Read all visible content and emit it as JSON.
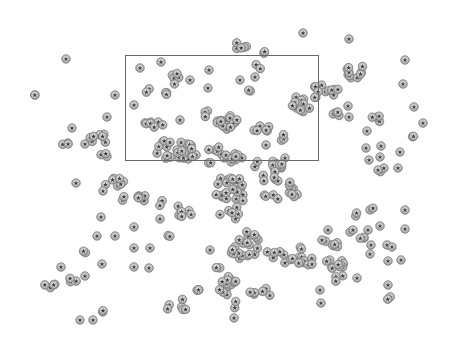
{
  "image": {
    "width": 451,
    "height": 343,
    "background": "#ffffff",
    "description": "Grayscale micrograph of spherical particles with a rectangular selection region"
  },
  "selection_box": {
    "x": 125,
    "y": 55,
    "width": 193,
    "height": 105,
    "stroke": "#6a6a6a"
  },
  "particle_style": {
    "radius": 4.2,
    "fill": "#d4d4d4",
    "ring": "#7a7a7a",
    "core": "#3a3a3a"
  },
  "clusters": [
    {
      "cx": 66,
      "cy": 59,
      "n": 1,
      "sx": 0,
      "sy": 0
    },
    {
      "cx": 34,
      "cy": 95,
      "n": 2,
      "sx": 3,
      "sy": 0
    },
    {
      "cx": 115,
      "cy": 95,
      "n": 1,
      "sx": 0,
      "sy": 0
    },
    {
      "cx": 107,
      "cy": 117,
      "n": 1,
      "sx": 0,
      "sy": 0
    },
    {
      "cx": 72,
      "cy": 128,
      "n": 1,
      "sx": 0,
      "sy": 0
    },
    {
      "cx": 66,
      "cy": 142,
      "n": 3,
      "sx": 5,
      "sy": 3
    },
    {
      "cx": 85,
      "cy": 144,
      "n": 1,
      "sx": 0,
      "sy": 0
    },
    {
      "cx": 98,
      "cy": 138,
      "n": 8,
      "sx": 10,
      "sy": 6
    },
    {
      "cx": 102,
      "cy": 155,
      "n": 3,
      "sx": 6,
      "sy": 2
    },
    {
      "cx": 140,
      "cy": 68,
      "n": 1,
      "sx": 0,
      "sy": 0
    },
    {
      "cx": 161,
      "cy": 62,
      "n": 1,
      "sx": 0,
      "sy": 0
    },
    {
      "cx": 175,
      "cy": 78,
      "n": 5,
      "sx": 4,
      "sy": 8
    },
    {
      "cx": 146,
      "cy": 90,
      "n": 2,
      "sx": 5,
      "sy": 3
    },
    {
      "cx": 165,
      "cy": 95,
      "n": 3,
      "sx": 4,
      "sy": 3
    },
    {
      "cx": 190,
      "cy": 80,
      "n": 1,
      "sx": 0,
      "sy": 0
    },
    {
      "cx": 209,
      "cy": 70,
      "n": 1,
      "sx": 0,
      "sy": 0
    },
    {
      "cx": 134,
      "cy": 105,
      "n": 1,
      "sx": 0,
      "sy": 0
    },
    {
      "cx": 208,
      "cy": 88,
      "n": 1,
      "sx": 0,
      "sy": 0
    },
    {
      "cx": 206,
      "cy": 113,
      "n": 3,
      "sx": 4,
      "sy": 4
    },
    {
      "cx": 153,
      "cy": 125,
      "n": 7,
      "sx": 16,
      "sy": 3
    },
    {
      "cx": 180,
      "cy": 120,
      "n": 1,
      "sx": 0,
      "sy": 0
    },
    {
      "cx": 227,
      "cy": 120,
      "n": 14,
      "sx": 10,
      "sy": 10
    },
    {
      "cx": 245,
      "cy": 45,
      "n": 5,
      "sx": 10,
      "sy": 4
    },
    {
      "cx": 265,
      "cy": 52,
      "n": 2,
      "sx": 2,
      "sy": 2
    },
    {
      "cx": 259,
      "cy": 66,
      "n": 2,
      "sx": 3,
      "sy": 4
    },
    {
      "cx": 240,
      "cy": 80,
      "n": 1,
      "sx": 0,
      "sy": 0
    },
    {
      "cx": 255,
      "cy": 77,
      "n": 1,
      "sx": 0,
      "sy": 0
    },
    {
      "cx": 248,
      "cy": 88,
      "n": 2,
      "sx": 4,
      "sy": 3
    },
    {
      "cx": 303,
      "cy": 33,
      "n": 1,
      "sx": 0,
      "sy": 0
    },
    {
      "cx": 349,
      "cy": 39,
      "n": 1,
      "sx": 0,
      "sy": 0
    },
    {
      "cx": 300,
      "cy": 105,
      "n": 14,
      "sx": 10,
      "sy": 8
    },
    {
      "cx": 326,
      "cy": 92,
      "n": 12,
      "sx": 14,
      "sy": 7
    },
    {
      "cx": 355,
      "cy": 72,
      "n": 10,
      "sx": 14,
      "sy": 6
    },
    {
      "cx": 337,
      "cy": 114,
      "n": 4,
      "sx": 5,
      "sy": 6
    },
    {
      "cx": 348,
      "cy": 106,
      "n": 1,
      "sx": 0,
      "sy": 0
    },
    {
      "cx": 349,
      "cy": 117,
      "n": 1,
      "sx": 0,
      "sy": 0
    },
    {
      "cx": 405,
      "cy": 60,
      "n": 1,
      "sx": 0,
      "sy": 0
    },
    {
      "cx": 403,
      "cy": 84,
      "n": 1,
      "sx": 0,
      "sy": 0
    },
    {
      "cx": 414,
      "cy": 107,
      "n": 1,
      "sx": 0,
      "sy": 0
    },
    {
      "cx": 423,
      "cy": 123,
      "n": 1,
      "sx": 0,
      "sy": 0
    },
    {
      "cx": 413,
      "cy": 137,
      "n": 2,
      "sx": 3,
      "sy": 2
    },
    {
      "cx": 376,
      "cy": 118,
      "n": 4,
      "sx": 4,
      "sy": 4
    },
    {
      "cx": 367,
      "cy": 131,
      "n": 1,
      "sx": 0,
      "sy": 0
    },
    {
      "cx": 366,
      "cy": 148,
      "n": 1,
      "sx": 0,
      "sy": 0
    },
    {
      "cx": 381,
      "cy": 146,
      "n": 1,
      "sx": 0,
      "sy": 0
    },
    {
      "cx": 369,
      "cy": 160,
      "n": 1,
      "sx": 0,
      "sy": 0
    },
    {
      "cx": 380,
      "cy": 157,
      "n": 1,
      "sx": 0,
      "sy": 0
    },
    {
      "cx": 400,
      "cy": 152,
      "n": 1,
      "sx": 0,
      "sy": 0
    },
    {
      "cx": 381,
      "cy": 170,
      "n": 2,
      "sx": 3,
      "sy": 2
    },
    {
      "cx": 398,
      "cy": 168,
      "n": 1,
      "sx": 0,
      "sy": 0
    },
    {
      "cx": 262,
      "cy": 127,
      "n": 6,
      "sx": 12,
      "sy": 4
    },
    {
      "cx": 283,
      "cy": 138,
      "n": 3,
      "sx": 4,
      "sy": 4
    },
    {
      "cx": 266,
      "cy": 145,
      "n": 1,
      "sx": 0,
      "sy": 0
    },
    {
      "cx": 285,
      "cy": 158,
      "n": 1,
      "sx": 0,
      "sy": 0
    },
    {
      "cx": 178,
      "cy": 150,
      "n": 26,
      "sx": 22,
      "sy": 10
    },
    {
      "cx": 225,
      "cy": 155,
      "n": 16,
      "sx": 18,
      "sy": 8
    },
    {
      "cx": 268,
      "cy": 165,
      "n": 10,
      "sx": 14,
      "sy": 5
    },
    {
      "cx": 115,
      "cy": 182,
      "n": 7,
      "sx": 10,
      "sy": 4
    },
    {
      "cx": 76,
      "cy": 183,
      "n": 1,
      "sx": 0,
      "sy": 0
    },
    {
      "cx": 103,
      "cy": 191,
      "n": 1,
      "sx": 0,
      "sy": 0
    },
    {
      "cx": 123,
      "cy": 198,
      "n": 2,
      "sx": 3,
      "sy": 3
    },
    {
      "cx": 143,
      "cy": 200,
      "n": 6,
      "sx": 6,
      "sy": 5
    },
    {
      "cx": 160,
      "cy": 203,
      "n": 2,
      "sx": 3,
      "sy": 3
    },
    {
      "cx": 101,
      "cy": 217,
      "n": 1,
      "sx": 0,
      "sy": 0
    },
    {
      "cx": 134,
      "cy": 227,
      "n": 1,
      "sx": 0,
      "sy": 0
    },
    {
      "cx": 160,
      "cy": 219,
      "n": 1,
      "sx": 0,
      "sy": 0
    },
    {
      "cx": 186,
      "cy": 212,
      "n": 7,
      "sx": 8,
      "sy": 8
    },
    {
      "cx": 97,
      "cy": 236,
      "n": 1,
      "sx": 0,
      "sy": 0
    },
    {
      "cx": 115,
      "cy": 236,
      "n": 1,
      "sx": 0,
      "sy": 0
    },
    {
      "cx": 134,
      "cy": 248,
      "n": 1,
      "sx": 0,
      "sy": 0
    },
    {
      "cx": 150,
      "cy": 248,
      "n": 1,
      "sx": 0,
      "sy": 0
    },
    {
      "cx": 171,
      "cy": 237,
      "n": 2,
      "sx": 3,
      "sy": 3
    },
    {
      "cx": 86,
      "cy": 253,
      "n": 2,
      "sx": 3,
      "sy": 2
    },
    {
      "cx": 61,
      "cy": 267,
      "n": 1,
      "sx": 0,
      "sy": 0
    },
    {
      "cx": 102,
      "cy": 264,
      "n": 1,
      "sx": 0,
      "sy": 0
    },
    {
      "cx": 134,
      "cy": 267,
      "n": 1,
      "sx": 0,
      "sy": 0
    },
    {
      "cx": 149,
      "cy": 268,
      "n": 1,
      "sx": 0,
      "sy": 0
    },
    {
      "cx": 50,
      "cy": 286,
      "n": 4,
      "sx": 6,
      "sy": 2
    },
    {
      "cx": 72,
      "cy": 280,
      "n": 3,
      "sx": 5,
      "sy": 2
    },
    {
      "cx": 85,
      "cy": 276,
      "n": 1,
      "sx": 0,
      "sy": 0
    },
    {
      "cx": 103,
      "cy": 311,
      "n": 2,
      "sx": 1,
      "sy": 3
    },
    {
      "cx": 80,
      "cy": 320,
      "n": 1,
      "sx": 0,
      "sy": 0
    },
    {
      "cx": 93,
      "cy": 320,
      "n": 1,
      "sx": 0,
      "sy": 0
    },
    {
      "cx": 182,
      "cy": 305,
      "n": 4,
      "sx": 7,
      "sy": 6
    },
    {
      "cx": 200,
      "cy": 290,
      "n": 3,
      "sx": 4,
      "sy": 4
    },
    {
      "cx": 168,
      "cy": 305,
      "n": 2,
      "sx": 2,
      "sy": 6
    },
    {
      "cx": 210,
      "cy": 250,
      "n": 1,
      "sx": 0,
      "sy": 0
    },
    {
      "cx": 217,
      "cy": 268,
      "n": 2,
      "sx": 3,
      "sy": 3
    },
    {
      "cx": 222,
      "cy": 290,
      "n": 5,
      "sx": 6,
      "sy": 5
    },
    {
      "cx": 237,
      "cy": 305,
      "n": 2,
      "sx": 3,
      "sy": 4
    },
    {
      "cx": 234,
      "cy": 318,
      "n": 1,
      "sx": 0,
      "sy": 0
    },
    {
      "cx": 230,
      "cy": 200,
      "n": 28,
      "sx": 14,
      "sy": 22
    },
    {
      "cx": 245,
      "cy": 245,
      "n": 20,
      "sx": 16,
      "sy": 14
    },
    {
      "cx": 270,
      "cy": 185,
      "n": 10,
      "sx": 10,
      "sy": 14
    },
    {
      "cx": 292,
      "cy": 190,
      "n": 8,
      "sx": 6,
      "sy": 10
    },
    {
      "cx": 285,
      "cy": 255,
      "n": 14,
      "sx": 18,
      "sy": 8
    },
    {
      "cx": 228,
      "cy": 280,
      "n": 8,
      "sx": 8,
      "sy": 5
    },
    {
      "cx": 260,
      "cy": 292,
      "n": 6,
      "sx": 12,
      "sy": 4
    },
    {
      "cx": 305,
      "cy": 262,
      "n": 6,
      "sx": 8,
      "sy": 4
    },
    {
      "cx": 335,
      "cy": 270,
      "n": 14,
      "sx": 10,
      "sy": 12
    },
    {
      "cx": 330,
      "cy": 245,
      "n": 6,
      "sx": 8,
      "sy": 4
    },
    {
      "cx": 322,
      "cy": 240,
      "n": 1,
      "sx": 0,
      "sy": 0
    },
    {
      "cx": 328,
      "cy": 230,
      "n": 1,
      "sx": 0,
      "sy": 0
    },
    {
      "cx": 360,
      "cy": 236,
      "n": 3,
      "sx": 5,
      "sy": 3
    },
    {
      "cx": 350,
      "cy": 232,
      "n": 1,
      "sx": 0,
      "sy": 0
    },
    {
      "cx": 357,
      "cy": 278,
      "n": 1,
      "sx": 0,
      "sy": 0
    },
    {
      "cx": 320,
      "cy": 290,
      "n": 1,
      "sx": 0,
      "sy": 0
    },
    {
      "cx": 321,
      "cy": 303,
      "n": 1,
      "sx": 0,
      "sy": 0
    },
    {
      "cx": 355,
      "cy": 215,
      "n": 2,
      "sx": 2,
      "sy": 2
    },
    {
      "cx": 373,
      "cy": 210,
      "n": 2,
      "sx": 3,
      "sy": 2
    },
    {
      "cx": 353,
      "cy": 230,
      "n": 1,
      "sx": 0,
      "sy": 0
    },
    {
      "cx": 380,
      "cy": 226,
      "n": 1,
      "sx": 0,
      "sy": 0
    },
    {
      "cx": 368,
      "cy": 230,
      "n": 1,
      "sx": 0,
      "sy": 0
    },
    {
      "cx": 371,
      "cy": 245,
      "n": 1,
      "sx": 0,
      "sy": 0
    },
    {
      "cx": 387,
      "cy": 245,
      "n": 1,
      "sx": 0,
      "sy": 0
    },
    {
      "cx": 405,
      "cy": 210,
      "n": 1,
      "sx": 0,
      "sy": 0
    },
    {
      "cx": 405,
      "cy": 229,
      "n": 1,
      "sx": 0,
      "sy": 0
    },
    {
      "cx": 392,
      "cy": 247,
      "n": 1,
      "sx": 0,
      "sy": 0
    },
    {
      "cx": 370,
      "cy": 254,
      "n": 1,
      "sx": 0,
      "sy": 0
    },
    {
      "cx": 388,
      "cy": 261,
      "n": 1,
      "sx": 0,
      "sy": 0
    },
    {
      "cx": 401,
      "cy": 260,
      "n": 1,
      "sx": 0,
      "sy": 0
    },
    {
      "cx": 388,
      "cy": 285,
      "n": 1,
      "sx": 0,
      "sy": 0
    },
    {
      "cx": 390,
      "cy": 298,
      "n": 2,
      "sx": 3,
      "sy": 2
    },
    {
      "cx": 378,
      "cy": 170,
      "n": 1,
      "sx": 0,
      "sy": 0
    }
  ]
}
